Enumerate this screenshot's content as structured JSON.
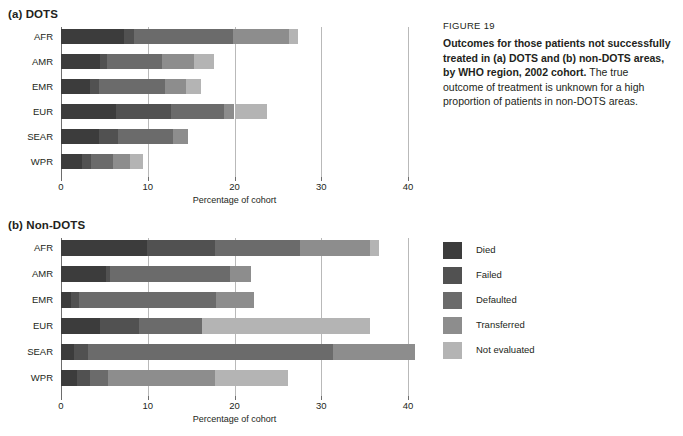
{
  "figure": {
    "number_label": "FIGURE 19",
    "title_bold": "Outcomes for those patients not successfully treated in (a) DOTS and (b) non-DOTS areas, by WHO region, 2002 cohort.",
    "body_text": " The true outcome of treatment is unknown for a high proportion of patients in non-DOTS areas."
  },
  "legend": {
    "items": [
      {
        "label": "Died",
        "color": "#3c3c3c"
      },
      {
        "label": "Failed",
        "color": "#515151"
      },
      {
        "label": "Defaulted",
        "color": "#6b6b6b"
      },
      {
        "label": "Transferred",
        "color": "#8d8d8d"
      },
      {
        "label": "Not evaluated",
        "color": "#b4b4b4"
      }
    ]
  },
  "panels": {
    "a": {
      "title": "(a) DOTS",
      "xlabel": "Percentage of cohort"
    },
    "b": {
      "title": "(b) Non-DOTS",
      "xlabel": "Percentage of cohort"
    }
  },
  "axis": {
    "ticks": [
      0,
      10,
      20,
      30,
      40
    ],
    "tick_labels": [
      "0",
      "10",
      "20",
      "30",
      "40"
    ],
    "min": 0,
    "max": 40
  },
  "chart_data": [
    {
      "type": "bar",
      "orientation": "horizontal",
      "stacked": true,
      "title": "(a) DOTS",
      "xlabel": "Percentage of cohort",
      "ylabel": "",
      "xlim": [
        0,
        40
      ],
      "grid": true,
      "legend_position": "right-outside",
      "categories": [
        "AFR",
        "AMR",
        "EMR",
        "EUR",
        "SEAR",
        "WPR"
      ],
      "series": [
        {
          "name": "Died",
          "values": [
            7.3,
            4.5,
            3.4,
            6.3,
            4.4,
            2.4
          ]
        },
        {
          "name": "Failed",
          "values": [
            1.1,
            0.8,
            1.0,
            6.4,
            2.2,
            1.1
          ]
        },
        {
          "name": "Defaulted",
          "values": [
            11.4,
            6.4,
            7.6,
            6.1,
            6.3,
            2.5
          ]
        },
        {
          "name": "Transferred",
          "values": [
            6.5,
            3.6,
            2.4,
            1.2,
            1.7,
            1.9
          ]
        },
        {
          "name": "Not evaluated",
          "values": [
            1.0,
            2.3,
            1.7,
            3.8,
            0.0,
            1.6
          ]
        }
      ],
      "totals": [
        27.3,
        17.6,
        16.1,
        23.8,
        14.6,
        9.5
      ]
    },
    {
      "type": "bar",
      "orientation": "horizontal",
      "stacked": true,
      "title": "(b) Non-DOTS",
      "xlabel": "Percentage of cohort",
      "ylabel": "",
      "xlim": [
        0,
        40
      ],
      "grid": true,
      "legend_position": "right-outside",
      "categories": [
        "AFR",
        "AMR",
        "EMR",
        "EUR",
        "SEAR",
        "WPR"
      ],
      "series": [
        {
          "name": "Died",
          "values": [
            9.9,
            5.2,
            1.2,
            4.5,
            1.5,
            1.8
          ]
        },
        {
          "name": "Failed",
          "values": [
            7.9,
            0.4,
            0.9,
            4.5,
            1.6,
            1.5
          ]
        },
        {
          "name": "Defaulted",
          "values": [
            9.8,
            13.9,
            15.8,
            7.2,
            28.2,
            2.1
          ]
        },
        {
          "name": "Transferred",
          "values": [
            8.0,
            2.4,
            4.4,
            0.0,
            9.5,
            12.4
          ]
        },
        {
          "name": "Not evaluated",
          "values": [
            1.0,
            0.0,
            0.0,
            19.4,
            0.0,
            8.4
          ]
        }
      ],
      "totals": [
        36.6,
        21.9,
        22.3,
        35.6,
        40.8,
        26.2
      ]
    }
  ]
}
